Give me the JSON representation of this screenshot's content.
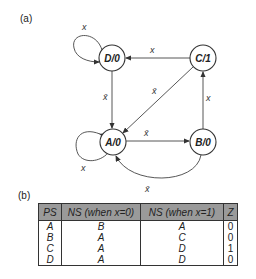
{
  "part_a_label": "(a)",
  "part_b_label": "(b)",
  "diagram": {
    "nodes": [
      {
        "id": "D",
        "label": "D/0",
        "x": 112,
        "y": 58
      },
      {
        "id": "C",
        "label": "C/1",
        "x": 203,
        "y": 58
      },
      {
        "id": "A",
        "label": "A/0",
        "x": 113,
        "y": 142
      },
      {
        "id": "B",
        "label": "B/0",
        "x": 203,
        "y": 142
      }
    ],
    "edges": [
      {
        "from": "D",
        "to": "D",
        "label": "x"
      },
      {
        "from": "C",
        "to": "D",
        "label": "x"
      },
      {
        "from": "D",
        "to": "A",
        "label": "x̄"
      },
      {
        "from": "C",
        "to": "A",
        "label": "x̄"
      },
      {
        "from": "B",
        "to": "C",
        "label": "x"
      },
      {
        "from": "A",
        "to": "B",
        "label": "x̄"
      },
      {
        "from": "A",
        "to": "A",
        "label": "x"
      },
      {
        "from": "B",
        "to": "A",
        "label": "x̄"
      }
    ]
  },
  "table": {
    "headers": [
      "PS",
      "NS (when x=0)",
      "NS (when x=1)",
      "Z"
    ],
    "rows": [
      {
        "ps": "A",
        "ns0": "B",
        "ns1": "A",
        "z": "0"
      },
      {
        "ps": "B",
        "ns0": "A",
        "ns1": "C",
        "z": "0"
      },
      {
        "ps": "C",
        "ns0": "A",
        "ns1": "D",
        "z": "1"
      },
      {
        "ps": "D",
        "ns0": "A",
        "ns1": "D",
        "z": "0"
      }
    ]
  }
}
